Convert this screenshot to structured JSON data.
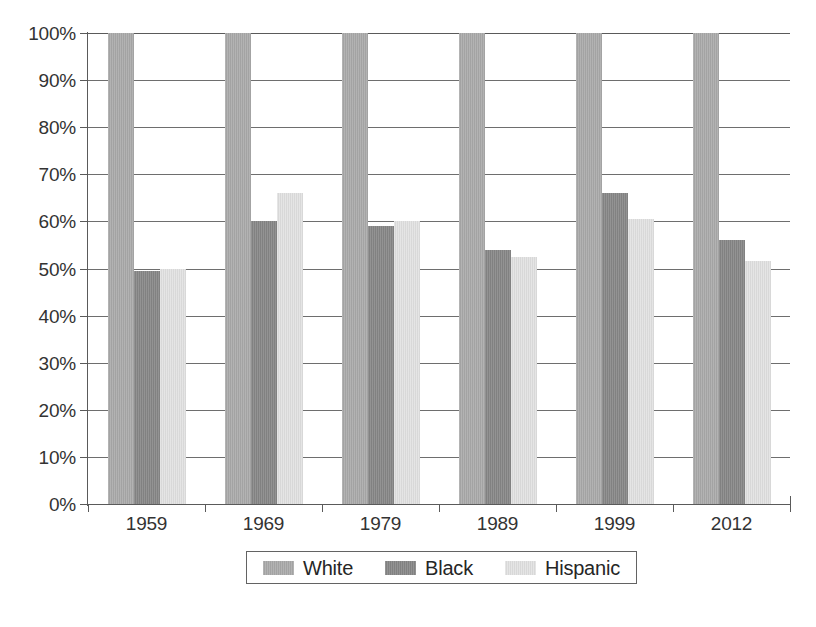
{
  "chart_data": {
    "type": "bar",
    "title": "",
    "subtitle": "",
    "xlabel": "",
    "ylabel": "",
    "categories": [
      "1959",
      "1969",
      "1979",
      "1989",
      "1999",
      "2012"
    ],
    "series": [
      {
        "name": "White",
        "color": "#aaaaaa",
        "values": [
          100,
          100,
          100,
          100,
          100,
          100
        ]
      },
      {
        "name": "Black",
        "color": "#878787",
        "values": [
          49.5,
          60,
          59,
          54,
          66,
          56
        ]
      },
      {
        "name": "Hispanic",
        "color": "#e2e2e2",
        "values": [
          50,
          66,
          60,
          52.5,
          60.5,
          51.5
        ]
      }
    ],
    "ylim": [
      0,
      100
    ],
    "y_ticks": [
      "0%",
      "10%",
      "20%",
      "30%",
      "40%",
      "50%",
      "60%",
      "70%",
      "80%",
      "90%",
      "100%"
    ],
    "y_tick_values": [
      0,
      10,
      20,
      30,
      40,
      50,
      60,
      70,
      80,
      90,
      100
    ],
    "grid": true,
    "legend_position": "bottom",
    "legend_entries": [
      "White",
      "Black",
      "Hispanic"
    ]
  }
}
